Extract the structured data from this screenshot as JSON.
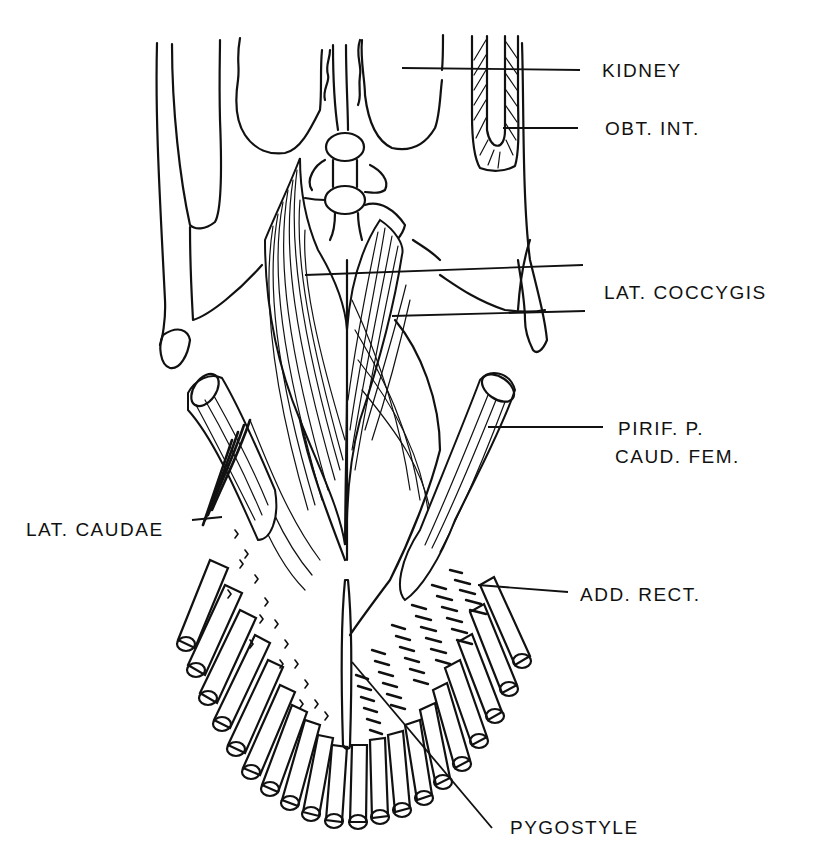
{
  "figure": {
    "type": "anatomical line drawing",
    "labels": [
      {
        "id": "kidney",
        "text": "KIDNEY"
      },
      {
        "id": "obt-int",
        "text": "OBT. INT."
      },
      {
        "id": "lat-coccygis",
        "text": "LAT. COCCYGIS"
      },
      {
        "id": "pirif-p",
        "text": "PIRIF. P."
      },
      {
        "id": "caud-fem",
        "text": "CAUD. FEM."
      },
      {
        "id": "lat-caudae",
        "text": "LAT. CAUDAE"
      },
      {
        "id": "add-rect",
        "text": "ADD. RECT."
      },
      {
        "id": "pygostyle",
        "text": "PYGOSTYLE"
      }
    ]
  }
}
